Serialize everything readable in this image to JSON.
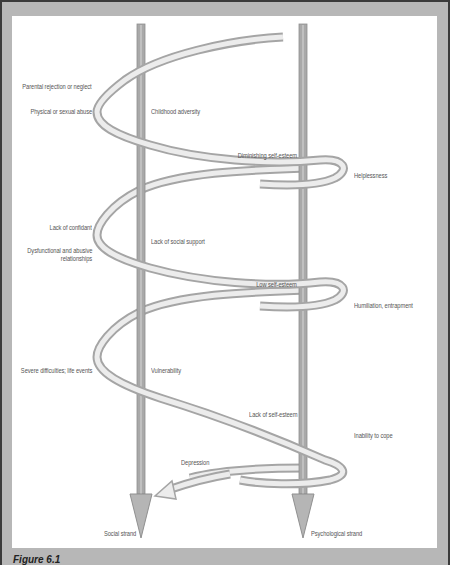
{
  "figure": {
    "caption": "Figure 6.1",
    "strands": {
      "social": "Social strand",
      "psychological": "Psychological strand"
    },
    "left_labels": {
      "parental": "Parental rejection or neglect",
      "abuse": "Physical or sexual abuse",
      "confidant": "Lack of confidant",
      "dysfunctional_1": "Dysfunctional and abusive",
      "dysfunctional_2": "relationships",
      "difficulties": "Severe difficulties; life events"
    },
    "social_labels": {
      "childhood": "Childhood adversity",
      "support": "Lack of social support",
      "vulnerability": "Vulnerability"
    },
    "psych_left_labels": {
      "diminishing": "Diminishing self-esteem",
      "low": "Low self-esteem",
      "lack": "Lack of self-esteem"
    },
    "psych_right_labels": {
      "helplessness": "Helplessness",
      "humiliation": "Humiliation, entrapment",
      "inability": "Inability to cope"
    },
    "outcome": "Depression",
    "colors": {
      "frame": "#b7b7b7",
      "border": "#3a3a3a",
      "strand": "#a9a9a9",
      "ribbon_edge": "#a5a5a5",
      "ribbon_fill": "#ececec"
    }
  }
}
